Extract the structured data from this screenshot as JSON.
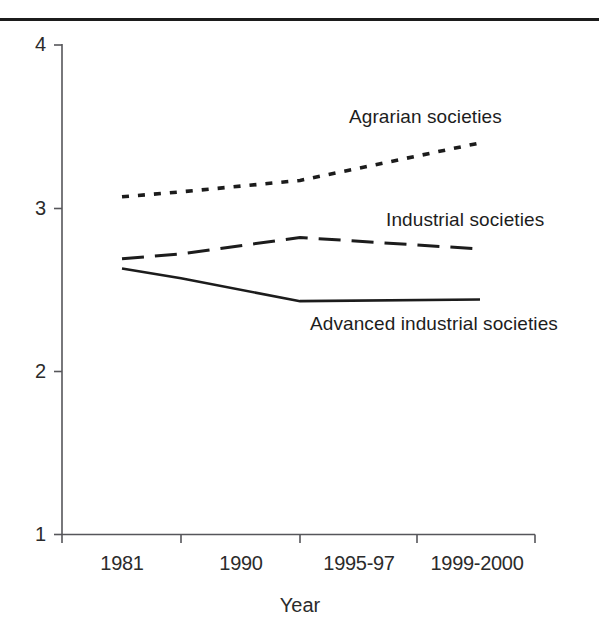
{
  "figure": {
    "has_top_rule": true,
    "background_color": "#ffffff",
    "ink_color": "#1c1c1c"
  },
  "chart_data": {
    "type": "line",
    "title": "",
    "xlabel": "Year",
    "ylabel": "",
    "categories": [
      "1981",
      "1990",
      "1995-97",
      "1999-2000"
    ],
    "ylim": [
      1,
      4
    ],
    "ytick_labels": [
      "1",
      "2",
      "3",
      "4"
    ],
    "ytick_values": [
      1,
      2,
      3,
      4
    ],
    "grid": false,
    "legend_position": "inline-annotations",
    "series": [
      {
        "name": "Agrarian societies",
        "style": "dotted",
        "values": [
          3.07,
          3.1,
          3.17,
          3.4
        ]
      },
      {
        "name": "Industrial societies",
        "style": "dashed",
        "values": [
          2.69,
          2.72,
          2.82,
          2.75
        ]
      },
      {
        "name": "Advanced industrial societies",
        "style": "solid",
        "values": [
          2.63,
          2.57,
          2.43,
          2.44
        ]
      }
    ],
    "annotations": [
      {
        "text": "Agrarian societies",
        "series": "Agrarian societies"
      },
      {
        "text": "Industrial societies",
        "series": "Industrial societies"
      },
      {
        "text": "Advanced industrial societies",
        "series": "Advanced industrial societies"
      }
    ]
  }
}
